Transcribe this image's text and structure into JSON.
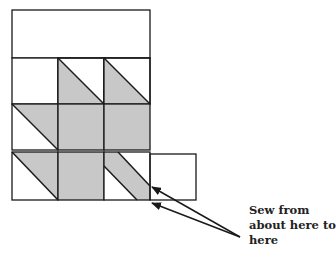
{
  "diagram": {
    "colors": {
      "fill": "#c8c8c8",
      "line": "#1a1a1a",
      "background": "#ffffff"
    },
    "top_strip": {
      "x": 12,
      "y": 10,
      "w": 138,
      "h": 48
    },
    "grid": {
      "x": 12,
      "y": 58,
      "cell": 46,
      "cols": 3,
      "rows": 3
    },
    "cells": [
      {
        "row": 0,
        "col": 0,
        "type": "plain"
      },
      {
        "row": 0,
        "col": 1,
        "type": "half-triangle-lower-left"
      },
      {
        "row": 0,
        "col": 2,
        "type": "half-triangle-lower-left"
      },
      {
        "row": 1,
        "col": 0,
        "type": "half-triangle-upper-right"
      },
      {
        "row": 1,
        "col": 1,
        "type": "filled"
      },
      {
        "row": 1,
        "col": 2,
        "type": "filled"
      },
      {
        "row": 2,
        "col": 0,
        "type": "half-triangle-upper-right"
      },
      {
        "row": 2,
        "col": 1,
        "type": "filled"
      },
      {
        "row": 2,
        "col": 2,
        "type": "diagonal-strip"
      }
    ],
    "extra_cell": {
      "x": 150,
      "y": 154,
      "w": 46,
      "h": 46
    },
    "arrows": [
      {
        "from": [
          240,
          237
        ],
        "to": [
          152,
          187
        ]
      },
      {
        "from": [
          240,
          237
        ],
        "to": [
          152,
          203
        ]
      }
    ]
  },
  "caption": {
    "lines": [
      "Sew from",
      "about here to",
      "here"
    ]
  }
}
